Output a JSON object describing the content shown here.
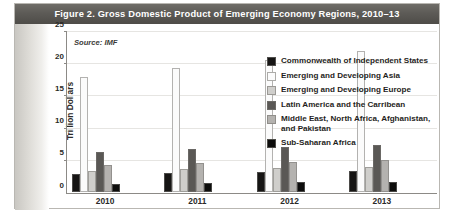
{
  "figure": {
    "title": "Figure 2. Gross Domestic Product of Emerging Economy Regions, 2010–13",
    "source_note": "Source: IMF"
  },
  "colors": {
    "title_band": "#5d5b57",
    "frame_border": "#b9b7b2",
    "axis": "#8c8a86",
    "gridline": "#e6e5e2",
    "series": [
      "#161514",
      "#fbfbfb",
      "#cfcecb",
      "#5a5855",
      "#b4b2af",
      "#0d0d0c"
    ]
  },
  "chart_data": {
    "type": "bar",
    "title": "Figure 2. Gross Domestic Product of Emerging Economy Regions, 2010–13",
    "xlabel": "",
    "ylabel": "Trillion Dollars",
    "ylim": [
      0,
      25
    ],
    "yticks": [
      0,
      5,
      10,
      15,
      20,
      25
    ],
    "ytick_labels": [
      "0",
      "5",
      "10",
      "15",
      "20",
      "25"
    ],
    "grid": true,
    "legend_position": "right",
    "categories": [
      "2010",
      "2011",
      "2012",
      "2013"
    ],
    "series": [
      {
        "name": "Commonwealth of Independent States",
        "color": "#161514",
        "values": [
          2.8,
          3.0,
          3.2,
          3.3
        ]
      },
      {
        "name": "Emerging and Developing Asia",
        "color": "#fbfbfb",
        "values": [
          18.0,
          19.3,
          20.6,
          22.1
        ]
      },
      {
        "name": "Emerging and Developing Europe",
        "color": "#cfcecb",
        "values": [
          3.3,
          3.6,
          3.7,
          3.9
        ]
      },
      {
        "name": "Latin America and the Carribean",
        "color": "#5a5855",
        "values": [
          6.3,
          6.7,
          7.0,
          7.4
        ]
      },
      {
        "name": "Middle East, North Africa, Afghanistan, and Pakistan",
        "color": "#b4b2af",
        "values": [
          4.2,
          4.5,
          4.7,
          5.0
        ]
      },
      {
        "name": "Sub-Saharan Africa",
        "color": "#0d0d0c",
        "values": [
          1.3,
          1.4,
          1.5,
          1.6
        ]
      }
    ]
  },
  "legend": {
    "items": [
      {
        "label": "Commonwealth of Independent States"
      },
      {
        "label": "Emerging and Developing Asia"
      },
      {
        "label": "Emerging and Developing Europe"
      },
      {
        "label": "Latin America and the Carribean"
      },
      {
        "label": "Middle East, North Africa, Afghanistan, and Pakistan"
      },
      {
        "label": "Sub-Saharan Africa"
      }
    ]
  },
  "axis": {
    "y_title": "Trillion Dollars"
  }
}
